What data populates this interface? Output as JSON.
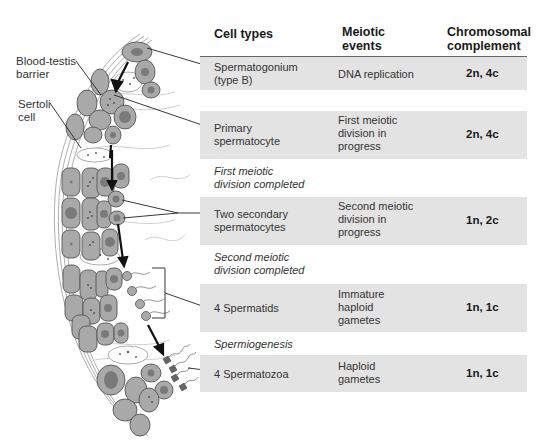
{
  "side_labels": {
    "blood_testis_barrier": [
      "Blood-testis",
      "barrier"
    ],
    "sertoli_cell": [
      "Sertoli",
      "cell"
    ]
  },
  "table": {
    "headers": {
      "cell_types": "Cell types",
      "meiotic_events": [
        "Meiotic",
        "events"
      ],
      "chromosomal_complement": [
        "Chromosomal",
        "complement"
      ]
    },
    "rows": [
      {
        "cell_type": [
          "Spermatogonium",
          "(type B)"
        ],
        "meiotic_event": [
          "DNA replication"
        ],
        "complement": "2n, 4c"
      },
      {
        "cell_type": [
          "Primary",
          "spermatocyte"
        ],
        "meiotic_event": [
          "First meiotic",
          "division in",
          "progress"
        ],
        "complement": "2n, 4c"
      },
      {
        "cell_type": [
          "Two secondary",
          "spermatocytes"
        ],
        "meiotic_event": [
          "Second meiotic",
          "division in",
          "progress"
        ],
        "complement": "1n, 2c"
      },
      {
        "cell_type": [
          "4 Spermatids"
        ],
        "meiotic_event": [
          "Immature",
          "haploid",
          "gametes"
        ],
        "complement": "1n, 1c"
      },
      {
        "cell_type": [
          "4 Spermatozoa"
        ],
        "meiotic_event": [
          "Haploid",
          "gametes"
        ],
        "complement": "1n, 1c"
      }
    ],
    "transitions": [
      [
        "First meiotic",
        "division completed"
      ],
      [
        "Second meiotic",
        "division completed"
      ],
      [
        "Spermiogenesis"
      ]
    ]
  },
  "colors": {
    "row_fill": "#e3e3e3",
    "cell_fill": "#a9a9a9",
    "nucleus_fill": "#7a7a7a",
    "outline": "#555555"
  }
}
